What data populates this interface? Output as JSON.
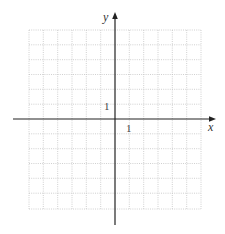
{
  "diagram": {
    "type": "coordinate-grid",
    "x_axis_label": "x",
    "y_axis_label": "y",
    "x_tick_label": "1",
    "y_tick_label": "1",
    "grid": {
      "columns_left_of_axis": 6,
      "columns_right_of_axis": 6,
      "rows_above_axis": 6,
      "rows_below_axis": 6,
      "line_style": "dotted",
      "line_color": "#bdbdbd"
    },
    "axis_color": "#222222"
  }
}
